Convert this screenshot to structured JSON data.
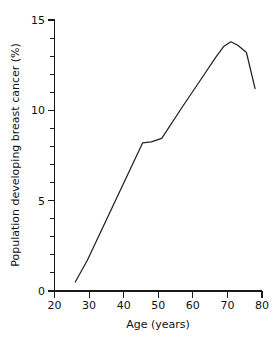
{
  "chart_data": {
    "type": "line",
    "title": "",
    "xlabel": "Age (years)",
    "ylabel": "Population developing breast cancer (%)",
    "xlim": [
      20,
      80
    ],
    "ylim": [
      0,
      15
    ],
    "grid": false,
    "legend": null,
    "x_ticks_major": [
      20,
      30,
      40,
      50,
      60,
      70,
      80
    ],
    "x_tick_labels": [
      "20",
      "30",
      "40",
      "50",
      "60",
      "70",
      "80"
    ],
    "y_ticks_major": [
      0,
      5,
      10,
      15
    ],
    "y_tick_labels": [
      "0",
      "5",
      "10",
      "15"
    ],
    "y_ticks_minor": [
      1,
      2,
      3,
      4,
      6,
      7,
      8,
      9,
      11,
      12,
      13,
      14
    ],
    "series": [
      {
        "name": "Population developing breast cancer",
        "color": "#222222",
        "x": [
          26,
          29.5,
          45.5,
          48,
          51,
          57,
          63,
          66.5,
          69,
          71,
          73,
          75.5,
          78
        ],
        "values": [
          0.5,
          1.7,
          8.2,
          8.25,
          8.45,
          10.2,
          11.9,
          12.9,
          13.55,
          13.8,
          13.6,
          13.2,
          11.2
        ]
      }
    ]
  },
  "axis": {
    "x_title": "Age (years)",
    "y_title": "Population developing breast cancer (%)"
  }
}
